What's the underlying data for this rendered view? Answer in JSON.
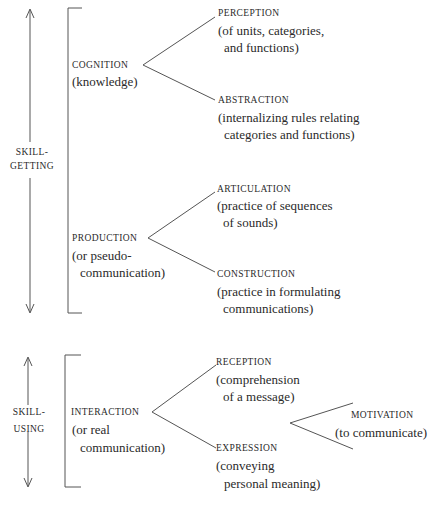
{
  "sections": {
    "skill_getting": {
      "label_line1": "SKILL-",
      "label_line2": "GETTING",
      "cognition": {
        "title": "COGNITION",
        "subtitle": "(knowledge)",
        "perception": {
          "title": "PERCEPTION",
          "line1": "(of units, categories,",
          "line2": "and functions)"
        },
        "abstraction": {
          "title": "ABSTRACTION",
          "line1": "(internalizing rules relating",
          "line2": "categories and functions)"
        }
      },
      "production": {
        "title": "PRODUCTION",
        "line1": "(or pseudo-",
        "line2": "communication)",
        "articulation": {
          "title": "ARTICULATION",
          "line1": "(practice of sequences",
          "line2": "of sounds)"
        },
        "construction": {
          "title": "CONSTRUCTION",
          "line1": "(practice in formulating",
          "line2": "communications)"
        }
      }
    },
    "skill_using": {
      "label_line1": "SKILL-",
      "label_line2": "USING",
      "interaction": {
        "title": "INTERACTION",
        "line1": "(or real",
        "line2": "communication)",
        "reception": {
          "title": "RECEPTION",
          "line1": "(comprehension",
          "line2": "of a message)"
        },
        "expression": {
          "title": "EXPRESSION",
          "line1": "(conveying",
          "line2": "personal meaning)"
        }
      },
      "motivation": {
        "title": "MOTIVATION",
        "line1": "(to communicate)"
      }
    }
  },
  "colors": {
    "ink": "#2a2a2a",
    "lines": "#555555",
    "background": "#ffffff"
  }
}
